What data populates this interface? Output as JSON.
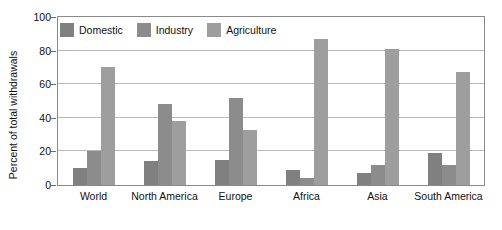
{
  "chart_data": {
    "type": "bar",
    "title": "",
    "subtitle": "",
    "xlabel": "",
    "ylabel": "Percent of total withdrawals",
    "ylim": [
      0,
      100
    ],
    "yticks": [
      0,
      20,
      40,
      60,
      80,
      100
    ],
    "ytick_labels": [
      "0",
      "20",
      "40",
      "60",
      "80",
      "100"
    ],
    "grid": true,
    "legend_position": "top-left-inside",
    "categories": [
      "World",
      "North America",
      "Europe",
      "Africa",
      "Asia",
      "South America"
    ],
    "series": [
      {
        "name": "Domestic",
        "color": "#808080",
        "values": [
          10,
          14,
          15,
          9,
          7,
          19
        ]
      },
      {
        "name": "Industry",
        "color": "#8c8c8c",
        "values": [
          20,
          48,
          52,
          4,
          12,
          12
        ]
      },
      {
        "name": "Agriculture",
        "color": "#9e9e9e",
        "values": [
          70,
          38,
          33,
          87,
          81,
          67
        ]
      }
    ]
  },
  "legend": {
    "items": [
      {
        "label": "Domestic",
        "color": "#808080"
      },
      {
        "label": "Industry",
        "color": "#8c8c8c"
      },
      {
        "label": "Agriculture",
        "color": "#9e9e9e"
      }
    ]
  },
  "axes": {
    "y_title": "Percent of total withdrawals",
    "frame_color": "#8a8a8a",
    "grid_color": "#b9b9b9"
  }
}
